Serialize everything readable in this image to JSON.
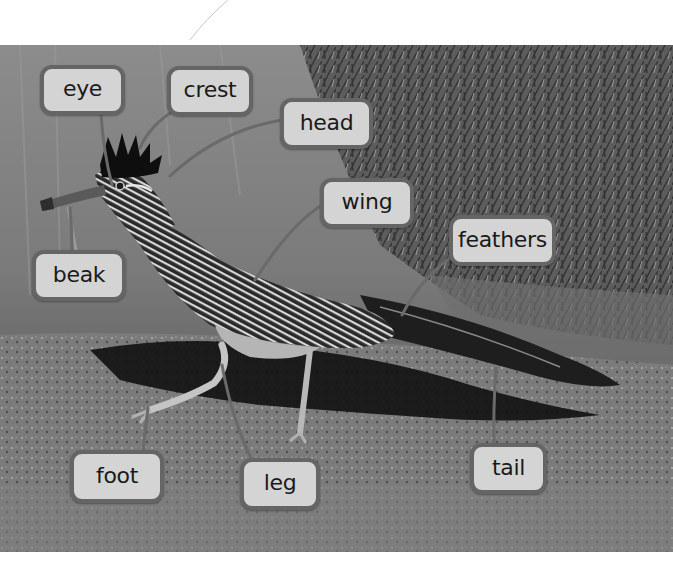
{
  "figure": {
    "colors": {
      "label_fill": "#d4d4d4",
      "label_border": "#656565",
      "label_text": "#1a1a1a",
      "leader_line": "#6a6a6a",
      "page_background": "#ffffff"
    },
    "labels": [
      {
        "id": "eye",
        "text": "eye"
      },
      {
        "id": "crest",
        "text": "crest"
      },
      {
        "id": "head",
        "text": "head"
      },
      {
        "id": "wing",
        "text": "wing"
      },
      {
        "id": "feathers",
        "text": "feathers"
      },
      {
        "id": "beak",
        "text": "beak"
      },
      {
        "id": "foot",
        "text": "foot"
      },
      {
        "id": "leg",
        "text": "leg"
      },
      {
        "id": "tail",
        "text": "tail"
      }
    ]
  }
}
